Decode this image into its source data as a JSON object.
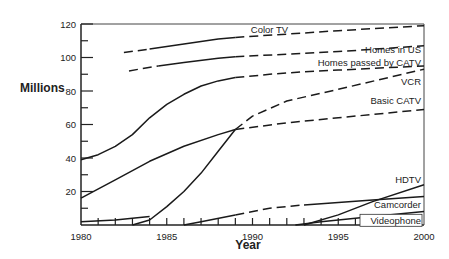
{
  "chart_data": {
    "type": "line",
    "title": "",
    "xlabel": "Year",
    "ylabel": "Millions",
    "xlim": [
      1980,
      2000
    ],
    "ylim": [
      0,
      120
    ],
    "x_ticks": [
      1980,
      1985,
      1990,
      1995,
      2000
    ],
    "y_ticks": [
      20,
      40,
      60,
      80,
      100,
      120
    ],
    "grid": false,
    "legend": "inline labels",
    "series": [
      {
        "name": "Color TV",
        "segments": [
          {
            "style": "dashed",
            "points": [
              [
                1982.5,
                103
              ],
              [
                1984,
                105
              ]
            ]
          },
          {
            "style": "solid",
            "points": [
              [
                1984,
                105
              ],
              [
                1986,
                108
              ],
              [
                1988,
                111
              ],
              [
                1989,
                112
              ]
            ]
          },
          {
            "style": "dashed",
            "points": [
              [
                1989,
                112
              ],
              [
                1992,
                114
              ],
              [
                1995,
                116
              ],
              [
                2000,
                119
              ]
            ]
          }
        ]
      },
      {
        "name": "Homes in US",
        "segments": [
          {
            "style": "dashed",
            "points": [
              [
                1982.8,
                92
              ],
              [
                1984.5,
                95
              ]
            ]
          },
          {
            "style": "solid",
            "points": [
              [
                1984.5,
                95
              ],
              [
                1986,
                97
              ],
              [
                1988,
                99.5
              ],
              [
                1989,
                100.5
              ]
            ]
          },
          {
            "style": "dashed",
            "points": [
              [
                1989,
                100.5
              ],
              [
                1992,
                102
              ],
              [
                1995,
                103.5
              ],
              [
                2000,
                107
              ]
            ]
          }
        ]
      },
      {
        "name": "Homes passed by CATV",
        "segments": [
          {
            "style": "solid",
            "points": [
              [
                1980,
                39
              ],
              [
                1981,
                42
              ],
              [
                1982,
                47
              ],
              [
                1983,
                54
              ],
              [
                1984,
                64
              ],
              [
                1985,
                72
              ],
              [
                1986,
                78
              ],
              [
                1987,
                83
              ],
              [
                1988,
                86
              ],
              [
                1989,
                88
              ]
            ]
          },
          {
            "style": "dashed",
            "points": [
              [
                1989,
                88
              ],
              [
                1991,
                90
              ],
              [
                1993,
                91.5
              ],
              [
                1995,
                92.5
              ],
              [
                2000,
                95
              ]
            ]
          }
        ]
      },
      {
        "name": "VCR",
        "segments": [
          {
            "style": "solid",
            "points": [
              [
                1983,
                0
              ],
              [
                1984,
                3
              ],
              [
                1985,
                11
              ],
              [
                1986,
                20
              ],
              [
                1987,
                31
              ],
              [
                1988,
                44
              ],
              [
                1989,
                57
              ]
            ]
          },
          {
            "style": "dashed",
            "points": [
              [
                1989,
                57
              ],
              [
                1990,
                65
              ],
              [
                1992,
                74
              ],
              [
                1995,
                81
              ],
              [
                2000,
                93
              ]
            ]
          }
        ]
      },
      {
        "name": "Basic CATV",
        "segments": [
          {
            "style": "solid",
            "points": [
              [
                1980,
                16
              ],
              [
                1982,
                27
              ],
              [
                1984,
                38
              ],
              [
                1986,
                47
              ],
              [
                1988,
                54
              ],
              [
                1989,
                57
              ]
            ]
          },
          {
            "style": "dashed",
            "points": [
              [
                1989,
                57
              ],
              [
                1992,
                61
              ],
              [
                1995,
                64
              ],
              [
                2000,
                69
              ]
            ]
          }
        ]
      },
      {
        "name": "HDTV",
        "segments": [
          {
            "style": "solid",
            "points": [
              [
                1993,
                0
              ],
              [
                1995,
                6
              ],
              [
                1997,
                14
              ],
              [
                2000,
                24
              ]
            ]
          }
        ]
      },
      {
        "name": "Camcorder",
        "segments": [
          {
            "style": "solid",
            "points": [
              [
                1986,
                0
              ],
              [
                1987,
                2
              ],
              [
                1989,
                6
              ]
            ]
          },
          {
            "style": "dashed",
            "points": [
              [
                1989,
                6
              ],
              [
                1991,
                10
              ],
              [
                1993,
                12
              ]
            ]
          },
          {
            "style": "solid",
            "points": [
              [
                1993,
                12
              ],
              [
                1995,
                13.5
              ],
              [
                1997,
                15
              ],
              [
                2000,
                17
              ]
            ]
          }
        ]
      },
      {
        "name": "Videophone",
        "segments": [
          {
            "style": "solid",
            "points": [
              [
                1980,
                2
              ],
              [
                1982,
                3
              ],
              [
                1983,
                4
              ],
              [
                1984,
                5
              ]
            ]
          },
          {
            "style": "solid",
            "points": [
              [
                1992.5,
                0
              ],
              [
                1994,
                2
              ],
              [
                1997,
                5
              ],
              [
                2000,
                8
              ]
            ]
          }
        ]
      }
    ],
    "labels": [
      {
        "text": "Color TV",
        "x": 1989.9,
        "y": 116.5
      },
      {
        "text": "Homes in US",
        "x": 2000,
        "y": 104.5,
        "anchor": "end"
      },
      {
        "text": "Homes passed by CATV",
        "x": 2000,
        "y": 97,
        "anchor": "end"
      },
      {
        "text": "VCR",
        "x": 2000,
        "y": 85.5,
        "anchor": "end"
      },
      {
        "text": "Basic CATV",
        "x": 2000,
        "y": 74.5,
        "anchor": "end"
      },
      {
        "text": "HDTV",
        "x": 2000,
        "y": 27,
        "anchor": "end"
      },
      {
        "text": "Camcorder",
        "x": 2000,
        "y": 12,
        "anchor": "end"
      },
      {
        "text": "Videophone",
        "x": 2000,
        "y": 2.5,
        "anchor": "end",
        "boxed": true
      }
    ]
  },
  "axes": {
    "y_label": "Millions",
    "x_label": "Year",
    "y_tick_labels": [
      "20",
      "40",
      "60",
      "80",
      "100",
      "120"
    ],
    "x_tick_labels": [
      "1980",
      "1985",
      "1990",
      "1995",
      "2000"
    ]
  }
}
